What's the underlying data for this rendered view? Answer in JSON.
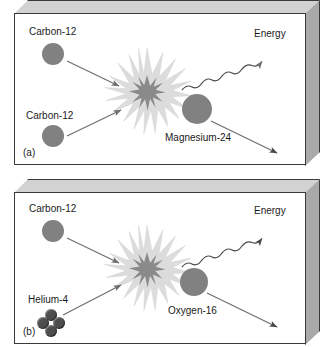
{
  "figure": {
    "type": "nuclear-fusion-reaction-diagram",
    "background_color": "#ffffff",
    "nucleus_color": "#818181",
    "burst_outer_color": "#d9d9d9",
    "burst_inner_color": "#8a8a8a",
    "arrow_color": "#6e6e6e",
    "panel_edge_color": "#3a3a3a",
    "panel_top_color": "#d2d2d2",
    "panel_side_color": "#a9a9a9"
  },
  "panels": [
    {
      "tag": "(a)",
      "reaction": "Carbon-12 + Carbon-12 -> Magnesium-24 + Energy",
      "reactants": [
        {
          "label": "Carbon-12",
          "shape": "sphere",
          "radius": 11
        },
        {
          "label": "Carbon-12",
          "shape": "sphere",
          "radius": 11
        }
      ],
      "products": [
        {
          "label": "Magnesium-24",
          "shape": "sphere",
          "radius": 15
        },
        {
          "label": "Energy",
          "shape": "wavy-arrow"
        }
      ]
    },
    {
      "tag": "(b)",
      "reaction": "Carbon-12 + Helium-4 -> Oxygen-16 + Energy",
      "reactants": [
        {
          "label": "Carbon-12",
          "shape": "sphere",
          "radius": 11
        },
        {
          "label": "Helium-4",
          "shape": "four-sphere-cluster",
          "radius": 6
        }
      ],
      "products": [
        {
          "label": "Oxygen-16",
          "shape": "sphere",
          "radius": 14
        },
        {
          "label": "Energy",
          "shape": "wavy-arrow"
        }
      ]
    }
  ],
  "labels": {
    "panel_a": {
      "tag": "(a)",
      "carbon_top": "Carbon-12",
      "carbon_bottom": "Carbon-12",
      "product": "Magnesium-24",
      "energy": "Energy"
    },
    "panel_b": {
      "tag": "(b)",
      "carbon_top": "Carbon-12",
      "helium": "Helium-4",
      "product": "Oxygen-16",
      "energy": "Energy"
    }
  }
}
